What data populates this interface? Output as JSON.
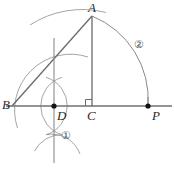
{
  "figure": {
    "kind": "geometry-construction-diagram",
    "width": 174,
    "height": 170,
    "background_color": "#ffffff",
    "stroke_color": "#6e6e6e",
    "construction_arc_color": "#8d8d8d",
    "label_color": "#2b2b2b",
    "point_color": "#1a1a1a"
  },
  "labels": {
    "A": "A",
    "B": "B",
    "C": "C",
    "D": "D",
    "P": "P",
    "step_one": "①",
    "step_two": "②"
  },
  "points": {
    "A": {
      "name": "A",
      "x": 92,
      "y": 16,
      "marked": false
    },
    "B": {
      "name": "B",
      "x": 12,
      "y": 106,
      "marked": false
    },
    "C": {
      "name": "C",
      "x": 92,
      "y": 106,
      "marked": false
    },
    "D": {
      "name": "D",
      "x": 54,
      "y": 106,
      "marked": true
    },
    "P": {
      "name": "P",
      "x": 148,
      "y": 106,
      "marked": true
    }
  },
  "segments": [
    {
      "name": "baseline-BP",
      "from": "B",
      "to": "P",
      "extends_past": true
    },
    {
      "name": "ray-BA",
      "from": "B",
      "to": "A"
    },
    {
      "name": "altitude-AC",
      "from": "A",
      "to": "C"
    },
    {
      "name": "perpendicular-through-D",
      "vertical": true,
      "x": 54,
      "y1": 38,
      "y2": 163
    }
  ],
  "arcs": {
    "arc_one": {
      "label": "①",
      "description": "pair of equal-radius construction arcs crossing above and below D",
      "center_left": {
        "x": 36,
        "y": 106
      },
      "center_right": {
        "x": 72,
        "y": 106
      },
      "radius": 30
    },
    "arc_two": {
      "label": "②",
      "description": "arc centered at C from A sweeping down to P",
      "center": {
        "x": 92,
        "y": 106
      },
      "radius": 90,
      "from": "A",
      "to": "P"
    },
    "arc_bisect": {
      "description": "construction arc through A from upper-left region",
      "center": {
        "x": 54,
        "y": 106
      },
      "radius": 96
    },
    "arc_small_inner": {
      "description": "small construction arc sweeping from lower-left up toward A region",
      "center": {
        "x": 54,
        "y": 106
      },
      "radius": 56
    }
  },
  "markers": {
    "right_angle_at_C": {
      "name": "right-angle-marker",
      "x": 86,
      "y": 100,
      "size": 7,
      "vertex": "C"
    }
  },
  "label_positions": {
    "A": {
      "x": 88,
      "y": 2
    },
    "B": {
      "x": 2,
      "y": 99
    },
    "C": {
      "x": 88,
      "y": 109
    },
    "D": {
      "x": 57,
      "y": 109
    },
    "P": {
      "x": 152,
      "y": 109
    },
    "step_one": {
      "x": 62,
      "y": 131
    },
    "step_two": {
      "x": 135,
      "y": 40
    }
  }
}
